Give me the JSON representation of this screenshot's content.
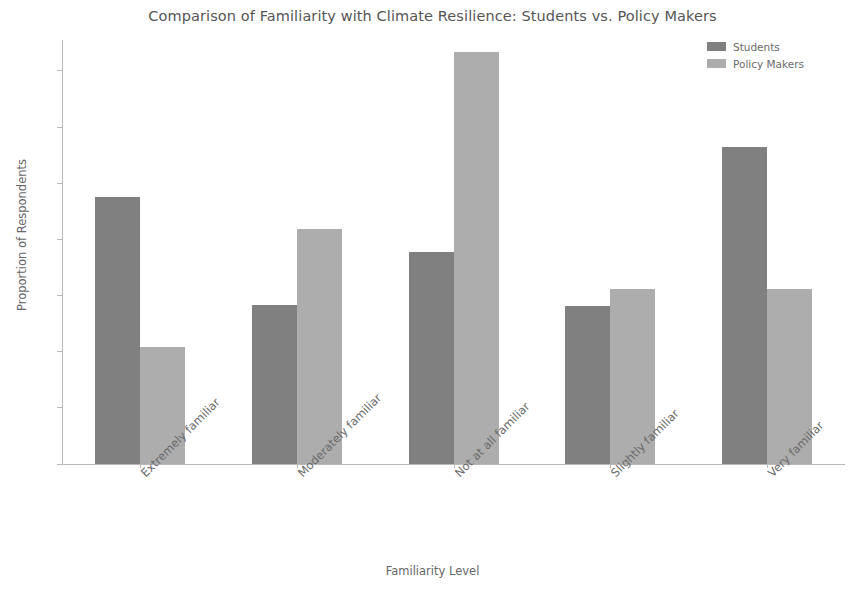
{
  "chart_data": {
    "type": "bar",
    "title": "Comparison of Familiarity with Climate Resilience: Students vs. Policy Makers",
    "xlabel": "Familiarity Level",
    "ylabel": "Proportion of Respondents",
    "categories": [
      "Extremely familiar",
      "Moderately familiar",
      "Not at all familiar",
      "Slightly familiar",
      "Very familiar"
    ],
    "series": [
      {
        "name": "Students",
        "color": "#808080",
        "values": [
          0.238,
          0.142,
          0.189,
          0.141,
          0.282
        ]
      },
      {
        "name": "Policy Makers",
        "color": "#adadad",
        "values": [
          0.104,
          0.209,
          0.367,
          0.156,
          0.156
        ]
      }
    ],
    "ylim": [
      0.0,
      0.3775
    ],
    "yticks": [
      "0.00",
      "0.05",
      "0.10",
      "0.15",
      "0.20",
      "0.25",
      "0.30",
      "0.35"
    ],
    "ytick_values": [
      0.0,
      0.05,
      0.1,
      0.15,
      0.2,
      0.25,
      0.3,
      0.35
    ],
    "grid": false,
    "legend_position": "upper right",
    "xtick_rotation": 45
  },
  "legend": {
    "entries": [
      {
        "label": "Students"
      },
      {
        "label": "Policy Makers"
      }
    ]
  }
}
